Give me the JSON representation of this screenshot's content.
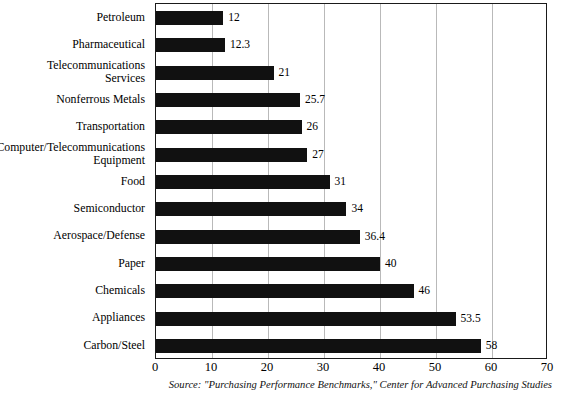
{
  "chart_data": {
    "type": "bar",
    "orientation": "horizontal",
    "title": "",
    "subtitle": "",
    "xlabel": "",
    "ylabel": "",
    "xlim": [
      0,
      70
    ],
    "ylim": null,
    "grid": true,
    "legend": null,
    "xticks": [
      "0",
      "10",
      "20",
      "30",
      "40",
      "50",
      "60",
      "70"
    ],
    "xtick_values": [
      0,
      10,
      20,
      30,
      40,
      50,
      60,
      70
    ],
    "categories": [
      "Petroleum",
      "Pharmaceutical",
      "Telecommunications\nServices",
      "Nonferrous Metals",
      "Transportation",
      "Computer/Telecommunications\nEquipment",
      "Food",
      "Semiconductor",
      "Aerospace/Defense",
      "Paper",
      "Chemicals",
      "Appliances",
      "Carbon/Steel"
    ],
    "values": [
      12,
      12.3,
      21,
      25.7,
      26,
      27,
      31,
      34,
      36.4,
      40,
      46,
      53.5,
      58
    ],
    "value_labels": [
      "12",
      "12.3",
      "21",
      "25.7",
      "26",
      "27",
      "31",
      "34",
      "36.4",
      "40",
      "46",
      "53.5",
      "58"
    ],
    "bar_color": "#111111",
    "grid_color": "#b9b9b9",
    "axis_color": "#1a1a1a"
  },
  "annotations": {
    "source": "Source: \"Purchasing Performance Benchmarks,\" Center for Advanced Purchasing Studies"
  }
}
